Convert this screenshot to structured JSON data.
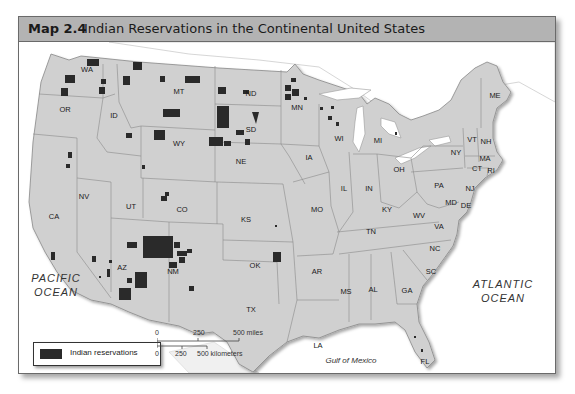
{
  "title": {
    "number": "Map 2.4",
    "text": "Indian Reservations in the Continental United States"
  },
  "states": [
    {
      "abbr": "WA",
      "x": 68,
      "y": 30
    },
    {
      "abbr": "OR",
      "x": 46,
      "y": 70
    },
    {
      "abbr": "ID",
      "x": 95,
      "y": 76
    },
    {
      "abbr": "MT",
      "x": 160,
      "y": 52
    },
    {
      "abbr": "WY",
      "x": 160,
      "y": 104
    },
    {
      "abbr": "ND",
      "x": 232,
      "y": 54
    },
    {
      "abbr": "SD",
      "x": 232,
      "y": 90
    },
    {
      "abbr": "NE",
      "x": 222,
      "y": 122
    },
    {
      "abbr": "MN",
      "x": 278,
      "y": 68
    },
    {
      "abbr": "WI",
      "x": 320,
      "y": 99
    },
    {
      "abbr": "MI",
      "x": 359,
      "y": 101
    },
    {
      "abbr": "IA",
      "x": 290,
      "y": 118
    },
    {
      "abbr": "IL",
      "x": 325,
      "y": 149
    },
    {
      "abbr": "IN",
      "x": 350,
      "y": 149
    },
    {
      "abbr": "OH",
      "x": 380,
      "y": 130
    },
    {
      "abbr": "KY",
      "x": 368,
      "y": 170
    },
    {
      "abbr": "TN",
      "x": 352,
      "y": 192
    },
    {
      "abbr": "MO",
      "x": 298,
      "y": 170
    },
    {
      "abbr": "KS",
      "x": 227,
      "y": 180
    },
    {
      "abbr": "CO",
      "x": 163,
      "y": 170
    },
    {
      "abbr": "UT",
      "x": 112,
      "y": 167
    },
    {
      "abbr": "NV",
      "x": 65,
      "y": 157
    },
    {
      "abbr": "CA",
      "x": 35,
      "y": 177
    },
    {
      "abbr": "AZ",
      "x": 103,
      "y": 228
    },
    {
      "abbr": "NM",
      "x": 154,
      "y": 232
    },
    {
      "abbr": "OK",
      "x": 236,
      "y": 226
    },
    {
      "abbr": "TX",
      "x": 232,
      "y": 270
    },
    {
      "abbr": "AR",
      "x": 298,
      "y": 232
    },
    {
      "abbr": "LA",
      "x": 299,
      "y": 306
    },
    {
      "abbr": "MS",
      "x": 327,
      "y": 252
    },
    {
      "abbr": "AL",
      "x": 354,
      "y": 250
    },
    {
      "abbr": "GA",
      "x": 388,
      "y": 251
    },
    {
      "abbr": "SC",
      "x": 412,
      "y": 232
    },
    {
      "abbr": "NC",
      "x": 416,
      "y": 209
    },
    {
      "abbr": "VA",
      "x": 420,
      "y": 187
    },
    {
      "abbr": "WV",
      "x": 400,
      "y": 176
    },
    {
      "abbr": "PA",
      "x": 420,
      "y": 146
    },
    {
      "abbr": "NY",
      "x": 437,
      "y": 113
    },
    {
      "abbr": "MD",
      "x": 432,
      "y": 163
    },
    {
      "abbr": "DE",
      "x": 447,
      "y": 166
    },
    {
      "abbr": "NJ",
      "x": 451,
      "y": 149
    },
    {
      "abbr": "CT",
      "x": 458,
      "y": 129
    },
    {
      "abbr": "RI",
      "x": 472,
      "y": 131
    },
    {
      "abbr": "MA",
      "x": 466,
      "y": 119
    },
    {
      "abbr": "VT",
      "x": 453,
      "y": 100
    },
    {
      "abbr": "NH",
      "x": 467,
      "y": 102
    },
    {
      "abbr": "ME",
      "x": 476,
      "y": 56
    },
    {
      "abbr": "FL",
      "x": 406,
      "y": 322
    }
  ],
  "water_labels": {
    "pacific_line1": "PACIFIC",
    "pacific_line2": "OCEAN",
    "atlantic_line1": "ATLANTIC",
    "atlantic_line2": "OCEAN",
    "gulf": "Gulf of Mexico"
  },
  "legend": {
    "label": "Indian reservations",
    "swatch_color": "#2a2a2a"
  },
  "scale_bar": {
    "miles": [
      "0",
      "250",
      "500 miles"
    ],
    "kilometers": [
      "0",
      "250",
      "500 kilometers"
    ]
  },
  "colors": {
    "land": "#d0d0d0",
    "reservation": "#2a2a2a",
    "title_bar": "#b3b3b3",
    "water": "#ffffff"
  }
}
